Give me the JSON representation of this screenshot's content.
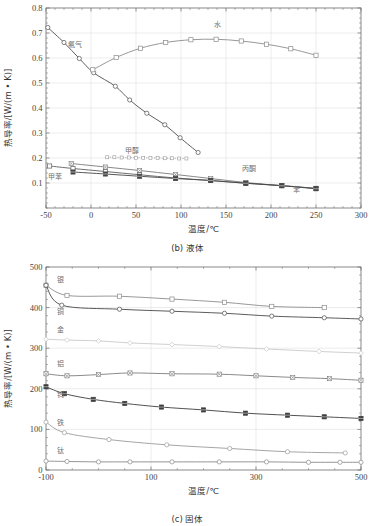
{
  "figure": {
    "title": "",
    "panels": [
      "b",
      "c"
    ]
  },
  "chart_data": [
    {
      "id": "liquid",
      "type": "line",
      "title": "",
      "caption": "(b) 液体",
      "xlabel": "温度/℃",
      "ylabel": "热导率/[W/(m • K)]",
      "xlim": [
        -50,
        300
      ],
      "ylim": [
        0,
        0.8
      ],
      "xticks": [
        -50,
        0,
        50,
        100,
        150,
        200,
        250,
        300
      ],
      "xticklabels": [
        "-50",
        "0",
        "50",
        "100",
        "150",
        "200",
        "250",
        "300"
      ],
      "yticks": [
        0.1,
        0.2,
        0.3,
        0.4,
        0.5,
        0.6,
        0.7,
        0.8
      ],
      "yticklabels": [
        "0.1",
        "0.2",
        "0.3",
        "0.4",
        "0.5",
        "0.6",
        "0.7",
        "0.8"
      ],
      "xminor_step": 10,
      "yminor_step": 0.02,
      "grid": "both",
      "legend": "inline-annotations",
      "series": [
        {
          "name": "氨气",
          "label": "氨气",
          "color": "#4d4d4d",
          "marker": "circle",
          "linestyle": "solid",
          "label_xy": [
            -18,
            0.645
          ],
          "x": [
            -48,
            -30,
            -13,
            3,
            27,
            43,
            62,
            82,
            99,
            119
          ],
          "y": [
            0.722,
            0.662,
            0.598,
            0.541,
            0.487,
            0.432,
            0.379,
            0.333,
            0.281,
            0.222
          ]
        },
        {
          "name": "水",
          "label": "水",
          "color": "#8c8c8c",
          "marker": "square",
          "linestyle": "solid",
          "label_xy": [
            140,
            0.726
          ],
          "x": [
            2,
            28,
            55,
            83,
            111,
            139,
            167,
            195,
            222,
            250
          ],
          "y": [
            0.553,
            0.602,
            0.639,
            0.662,
            0.673,
            0.675,
            0.668,
            0.655,
            0.637,
            0.611
          ]
        },
        {
          "name": "甲醇",
          "label": "甲醇",
          "color": "#9a9a9a",
          "marker": "smallsquare",
          "linestyle": "dotted",
          "label_xy": [
            45,
            0.222
          ],
          "x": [
            18,
            26,
            34,
            42,
            50,
            58,
            66,
            74,
            82,
            90,
            98,
            106
          ],
          "y": [
            0.203,
            0.203,
            0.202,
            0.202,
            0.201,
            0.201,
            0.2,
            0.2,
            0.199,
            0.199,
            0.198,
            0.198
          ]
        },
        {
          "name": "丙酮",
          "label": "丙酮",
          "color": "#7a7a7a",
          "marker": "cross",
          "linestyle": "solid",
          "label_xy": [
            175,
            0.148
          ],
          "x": [
            -22,
            16,
            54,
            94,
            133,
            172,
            212,
            250
          ],
          "y": [
            0.178,
            0.164,
            0.15,
            0.134,
            0.118,
            0.102,
            0.089,
            0.079
          ]
        },
        {
          "name": "甲苯",
          "label": "甲苯",
          "color": "#5f5f5f",
          "marker": "square",
          "linestyle": "solid",
          "label_xy": [
            -40,
            0.118
          ],
          "x": [
            -46,
            -20,
            16,
            54,
            94,
            133,
            172,
            212,
            250
          ],
          "y": [
            0.168,
            0.158,
            0.146,
            0.133,
            0.12,
            0.11,
            0.099,
            0.09,
            0.078
          ]
        },
        {
          "name": "苯",
          "label": "苯",
          "color": "#454545",
          "marker": "filledsquare",
          "linestyle": "solid",
          "label_xy": [
            228,
            0.063
          ],
          "x": [
            -20,
            16,
            54,
            94,
            133,
            172,
            212,
            250
          ],
          "y": [
            0.144,
            0.136,
            0.127,
            0.118,
            0.11,
            0.099,
            0.089,
            0.077
          ]
        }
      ]
    },
    {
      "id": "solid",
      "type": "line",
      "title": "",
      "caption": "(c) 固体",
      "xlabel": "温度/℃",
      "ylabel": "热导率/[W/(m • K)]",
      "xlim": [
        -100,
        500
      ],
      "ylim": [
        0,
        500
      ],
      "xticks": [
        -100,
        100,
        300,
        500
      ],
      "xticklabels": [
        "-100",
        "100",
        "300",
        "500"
      ],
      "yticks": [
        0,
        100,
        200,
        300,
        400,
        500
      ],
      "yticklabels": [
        "0",
        "100",
        "200",
        "300",
        "400",
        "500"
      ],
      "xminor_step": 50,
      "yminor_step": 20,
      "grid": "both",
      "legend": "inline-annotations",
      "series": [
        {
          "name": "银",
          "label": "银",
          "color": "#8c8c8c",
          "marker": "square",
          "linestyle": "solid",
          "label_xy": [
            -72,
            462
          ],
          "x": [
            -100,
            -60,
            40,
            140,
            240,
            330,
            430
          ],
          "y": [
            455,
            430,
            428,
            421,
            413,
            403,
            400
          ]
        },
        {
          "name": "铜",
          "label": "铜",
          "color": "#4a4a4a",
          "marker": "circle",
          "linestyle": "solid",
          "label_xy": [
            -72,
            384
          ],
          "x": [
            -100,
            -70,
            40,
            140,
            240,
            330,
            430,
            500
          ],
          "y": [
            455,
            406,
            396,
            391,
            386,
            379,
            375,
            372
          ]
        },
        {
          "name": "金",
          "label": "金",
          "color": "#c9c9c9",
          "marker": "diamond",
          "linestyle": "solid",
          "label_xy": [
            -72,
            340
          ],
          "x": [
            -100,
            -60,
            0,
            60,
            140,
            230,
            320,
            420,
            500
          ],
          "y": [
            322,
            320,
            318,
            313,
            309,
            304,
            298,
            292,
            288
          ]
        },
        {
          "name": "铝",
          "label": "铝",
          "color": "#7d7d7d",
          "marker": "cross",
          "linestyle": "solid",
          "label_xy": [
            -72,
            256
          ],
          "x": [
            -100,
            -60,
            0,
            60,
            140,
            230,
            300,
            370,
            440,
            500
          ],
          "y": [
            237,
            232,
            235,
            239,
            237,
            236,
            232,
            228,
            225,
            221
          ]
        },
        {
          "name": "钨",
          "label": "钨",
          "color": "#3d3d3d",
          "marker": "filledsquare",
          "linestyle": "solid",
          "label_xy": [
            -72,
            180
          ],
          "x": [
            -100,
            -65,
            -10,
            50,
            120,
            200,
            280,
            360,
            430,
            500
          ],
          "y": [
            205,
            188,
            174,
            164,
            155,
            148,
            140,
            135,
            131,
            127
          ]
        },
        {
          "name": "铁",
          "label": "铁",
          "color": "#9b9b9b",
          "marker": "circle",
          "linestyle": "solid",
          "label_xy": [
            -72,
            110
          ],
          "x": [
            -100,
            -65,
            20,
            130,
            250,
            360,
            470
          ],
          "y": [
            118,
            92,
            75,
            62,
            53,
            45,
            42
          ]
        },
        {
          "name": "钛",
          "label": "钛",
          "color": "#8a8a8a",
          "marker": "circle",
          "linestyle": "solid",
          "label_xy": [
            -72,
            42
          ],
          "x": [
            -100,
            -60,
            0,
            60,
            140,
            230,
            320,
            400,
            460,
            500
          ],
          "y": [
            22,
            21,
            20,
            20,
            20,
            20,
            20,
            19,
            19,
            19
          ]
        }
      ]
    }
  ]
}
